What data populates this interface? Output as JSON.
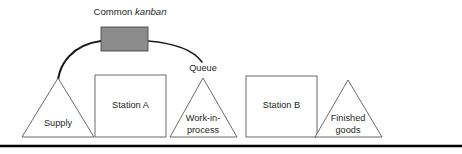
{
  "figure": {
    "kind": "process-flow-diagram",
    "width": 462,
    "height": 154,
    "background_color": "#ffffff",
    "title": {
      "text_plain": "Common kanban",
      "word_regular": "Common ",
      "word_italic": "kanban"
    },
    "labels": {
      "queue": "Queue"
    },
    "nodes": [
      {
        "id": "supply",
        "shape": "triangle",
        "label_line1": "Supply",
        "label_line2": ""
      },
      {
        "id": "station-a",
        "shape": "rectangle",
        "label_line1": "Station A",
        "label_line2": ""
      },
      {
        "id": "work-in-process",
        "shape": "triangle",
        "label_line1": "Work-in-",
        "label_line2": "process"
      },
      {
        "id": "station-b",
        "shape": "rectangle",
        "label_line1": "Station B",
        "label_line2": ""
      },
      {
        "id": "finished-goods",
        "shape": "triangle",
        "label_line1": "Finished",
        "label_line2": "goods"
      }
    ],
    "kanban_card": {
      "id": "common-kanban-card",
      "shape": "rectangle",
      "fill_color": "#8c8c8c",
      "stroke_color": "#4a4a4a"
    },
    "connectors": [
      {
        "id": "kanban-to-station-a",
        "from": "common-kanban-card",
        "to": "station-a",
        "style": "curved-arrow",
        "has_arrowhead": true
      },
      {
        "id": "kanban-to-queue",
        "from": "common-kanban-card",
        "to": "queue",
        "style": "curved-line",
        "has_arrowhead": false
      }
    ],
    "colors": {
      "outline": "#5a5a5a",
      "text": "#231f20",
      "connector": "#1a1a1a",
      "baseline": "#000000"
    }
  }
}
